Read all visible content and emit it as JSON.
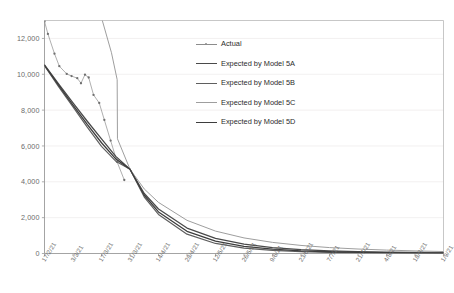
{
  "chart_data": {
    "type": "line",
    "title": "",
    "xlabel": "",
    "ylabel": "",
    "ylim": [
      0,
      13000
    ],
    "yticks": [
      0,
      2000,
      4000,
      6000,
      8000,
      10000,
      12000
    ],
    "ytick_labels": [
      "0",
      "2,000",
      "4,000",
      "6,000",
      "8,000",
      "10,000",
      "12,000"
    ],
    "grid": true,
    "grid_axis": "y",
    "legend_position": "upper-center-right",
    "categories": [
      "17/2/21",
      "3/3/21",
      "17/3/21",
      "31/3/21",
      "14/4/21",
      "28/4/21",
      "12/5/21",
      "26/5/21",
      "9/6/21",
      "23/6/21",
      "7/7/21",
      "21/7/21",
      "4/8/21",
      "18/8/21",
      "1/9/21"
    ],
    "xtick_labels": [
      "17/2/21",
      "3/3/21",
      "17/3/21",
      "31/3/21",
      "14/4/21",
      "28/4/21",
      "12/5/21",
      "26/5/21",
      "9/6/21",
      "23/6/21",
      "7/7/21",
      "21/7/21",
      "4/8/21",
      "18/8/21",
      "1/9/21"
    ],
    "series": [
      {
        "name": "Actual",
        "style": "line-marker",
        "color": "#8c8c8c",
        "x": [
          0.0,
          0.12,
          0.35,
          0.52,
          0.78,
          0.95,
          1.15,
          1.28,
          1.42,
          1.55,
          1.72,
          1.92,
          2.1,
          2.32,
          2.55,
          2.8
        ],
        "values": [
          12950,
          12250,
          11150,
          10450,
          10020,
          9900,
          9780,
          9500,
          9980,
          9820,
          8850,
          8400,
          7450,
          6300,
          5100,
          4100
        ]
      },
      {
        "name": "Expected by Model 5A",
        "style": "line",
        "color": "#4a4a4a",
        "x": [
          0.0,
          0.5,
          1.0,
          1.5,
          2.0,
          2.5,
          3.0,
          3.5,
          4.0,
          5.0,
          6.0,
          7.0,
          8.0,
          9.0,
          10.0,
          11.0,
          12.0,
          13.0,
          14.0
        ],
        "values": [
          10520,
          9450,
          8400,
          7380,
          6400,
          5420,
          4700,
          3350,
          2480,
          1420,
          840,
          520,
          330,
          215,
          150,
          110,
          80,
          60,
          45
        ]
      },
      {
        "name": "Expected by Model 5B",
        "style": "line",
        "color": "#5f5f5f",
        "x": [
          0.0,
          0.5,
          1.0,
          1.5,
          2.0,
          2.5,
          3.0,
          3.5,
          4.0,
          5.0,
          6.0,
          7.0,
          8.0,
          9.0,
          10.0,
          11.0,
          12.0,
          13.0,
          14.0
        ],
        "values": [
          10480,
          9300,
          8180,
          7050,
          5980,
          5150,
          4700,
          3150,
          2180,
          1080,
          560,
          300,
          170,
          100,
          62,
          42,
          30,
          22,
          16
        ]
      },
      {
        "name": "Expected by Model 5C",
        "style": "line",
        "color": "#9e9e9e",
        "x": [
          0.0,
          0.35,
          1.05,
          1.45,
          1.85,
          2.35,
          2.55,
          2.56,
          3.0,
          3.5,
          4.0,
          5.0,
          6.0,
          7.0,
          8.0,
          9.0,
          10.0,
          11.0,
          12.0,
          13.0,
          14.0
        ],
        "values": [
          12900,
          14300,
          15600,
          15800,
          14000,
          11200,
          9700,
          6400,
          4700,
          3600,
          2850,
          1850,
          1250,
          870,
          620,
          450,
          330,
          250,
          190,
          145,
          110
        ]
      },
      {
        "name": "Expected by Model 5D",
        "style": "line",
        "color": "#3d3d3d",
        "x": [
          0.0,
          0.5,
          1.0,
          1.5,
          2.0,
          2.5,
          3.0,
          3.5,
          4.0,
          5.0,
          6.0,
          7.0,
          8.0,
          9.0,
          10.0,
          11.0,
          12.0,
          13.0,
          14.0
        ],
        "values": [
          10500,
          9380,
          8280,
          7200,
          6180,
          5280,
          4700,
          3250,
          2320,
          1240,
          690,
          400,
          240,
          150,
          98,
          68,
          48,
          35,
          26
        ]
      }
    ]
  },
  "legend": {
    "items": [
      {
        "label": "Actual",
        "color": "#8c8c8c",
        "marker": true,
        "width": 0.8
      },
      {
        "label": "Expected by Model 5A",
        "color": "#4a4a4a",
        "marker": false,
        "width": 1.3
      },
      {
        "label": "Expected by Model 5B",
        "color": "#5f5f5f",
        "marker": false,
        "width": 1.2
      },
      {
        "label": "Expected by Model 5C",
        "color": "#9e9e9e",
        "marker": false,
        "width": 1.0
      },
      {
        "label": "Expected by Model 5D",
        "color": "#3d3d3d",
        "marker": false,
        "width": 1.3
      }
    ]
  }
}
